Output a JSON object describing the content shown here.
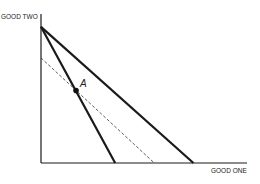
{
  "chart_data": {
    "type": "line",
    "title": "",
    "xlabel": "GOOD ONE",
    "ylabel": "GOOD TWO",
    "grid": false,
    "xlim": [
      0,
      100
    ],
    "ylim": [
      0,
      100
    ],
    "series": [
      {
        "name": "budget-line-steep",
        "style": "solid",
        "points": [
          [
            0,
            92
          ],
          [
            36,
            0
          ]
        ]
      },
      {
        "name": "budget-line-flat",
        "style": "solid",
        "points": [
          [
            0,
            92
          ],
          [
            74,
            0
          ]
        ]
      },
      {
        "name": "budget-line-dashed",
        "style": "dashed",
        "points": [
          [
            0,
            71
          ],
          [
            55,
            0
          ]
        ]
      }
    ],
    "annotations": [
      {
        "label": "A",
        "x": 17,
        "y": 49,
        "marker": "dot"
      }
    ]
  },
  "colors": {
    "line": "#1a1a1a",
    "dashed": "#333333"
  }
}
